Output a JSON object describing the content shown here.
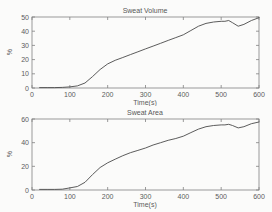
{
  "figure": {
    "background": "#fbfbfa",
    "line_color": "#4a4a4a",
    "axis_color": "#828282",
    "text_color": "#5c5c5c"
  },
  "chart_data": [
    {
      "type": "line",
      "title": "Sweat Volume",
      "xlabel": "Time(s)",
      "ylabel": "%",
      "xlim": [
        0,
        600
      ],
      "ylim": [
        0,
        50
      ],
      "xticks": [
        0,
        100,
        200,
        300,
        400,
        500,
        600
      ],
      "yticks": [
        0,
        10,
        20,
        30,
        40,
        50
      ],
      "grid": false,
      "legend": null,
      "x": [
        20,
        40,
        60,
        80,
        100,
        120,
        140,
        160,
        180,
        200,
        220,
        240,
        260,
        280,
        300,
        320,
        340,
        360,
        380,
        400,
        420,
        440,
        460,
        480,
        500,
        510,
        520,
        530,
        545,
        560,
        580,
        600
      ],
      "y": [
        0.3,
        0.3,
        0.3,
        0.4,
        0.8,
        1.5,
        3.5,
        8,
        13,
        17,
        19.5,
        21.5,
        23.5,
        25.5,
        27.5,
        29.5,
        31.5,
        33.5,
        35.5,
        37.5,
        40.5,
        43.5,
        45.5,
        46.5,
        47,
        47,
        47.5,
        46,
        43.5,
        44.8,
        47.5,
        49.5
      ]
    },
    {
      "type": "line",
      "title": "Sweat Area",
      "xlabel": "Time(s)",
      "ylabel": "%",
      "xlim": [
        0,
        600
      ],
      "ylim": [
        0,
        60
      ],
      "xticks": [
        0,
        100,
        200,
        300,
        400,
        500,
        600
      ],
      "yticks": [
        0,
        20,
        40,
        60
      ],
      "grid": false,
      "legend": null,
      "x": [
        20,
        40,
        60,
        80,
        100,
        120,
        140,
        160,
        180,
        200,
        220,
        240,
        260,
        280,
        300,
        320,
        340,
        360,
        380,
        400,
        420,
        440,
        460,
        480,
        500,
        510,
        520,
        530,
        545,
        560,
        580,
        600
      ],
      "y": [
        0.5,
        0.5,
        0.5,
        0.7,
        1.8,
        3,
        6.5,
        13,
        19,
        23,
        26,
        29,
        31.5,
        33.5,
        35.5,
        38,
        40,
        42,
        43.5,
        45.5,
        48.5,
        51.5,
        53.5,
        54.5,
        55,
        55,
        55.5,
        54.5,
        52.5,
        53.5,
        56,
        57.5
      ]
    }
  ]
}
